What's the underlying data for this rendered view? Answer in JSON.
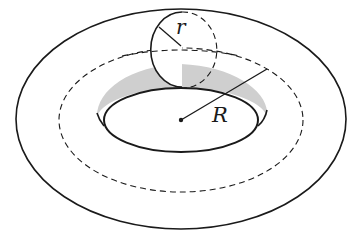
{
  "diagram": {
    "labels": {
      "minor_radius": "r",
      "major_radius": "R"
    },
    "colors": {
      "stroke": "#1a1a1a",
      "shading": "#cfcfcf",
      "background": "#ffffff"
    },
    "elements": [
      "outer-ellipse",
      "dashed-center-circle",
      "inner-hole-ellipse",
      "shaded-inner-wall",
      "cross-section-circle",
      "center-point",
      "major-radius-line",
      "minor-radius-line"
    ]
  }
}
